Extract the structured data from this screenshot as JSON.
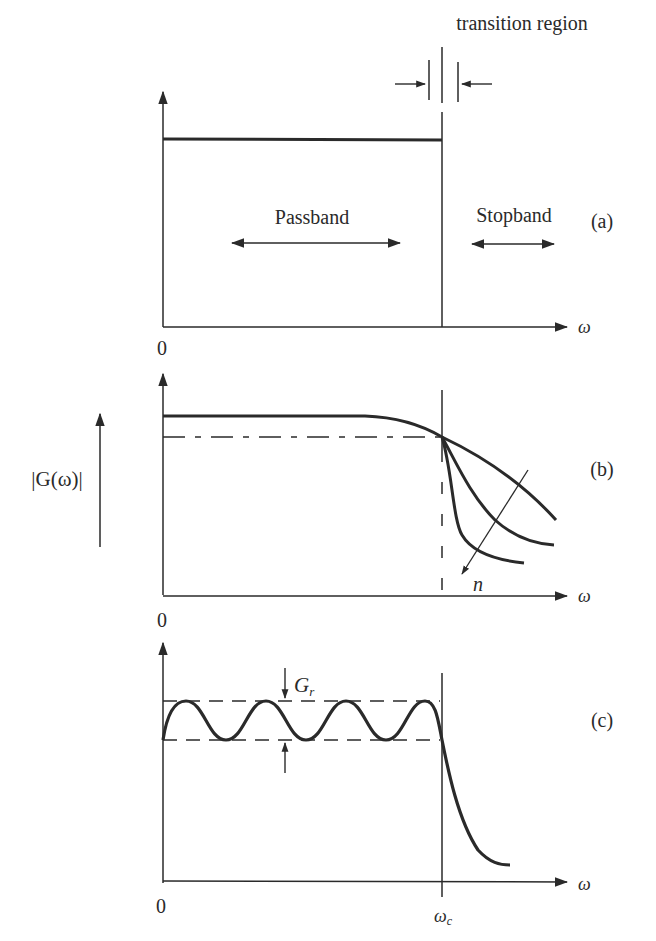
{
  "figure": {
    "transition_label": "transition region",
    "panel_a": {
      "tag": "(a)",
      "passband_label": "Passband",
      "stopband_label": "Stopband",
      "origin_label": "0",
      "x_axis_label": "ω"
    },
    "panel_b": {
      "tag": "(b)",
      "y_axis_label": "|G(ω)|",
      "origin_label": "0",
      "x_axis_label": "ω",
      "order_label": "n"
    },
    "panel_c": {
      "tag": "(c)",
      "ripple_label": "G",
      "ripple_subscript": "r",
      "origin_label": "0",
      "x_axis_label": "ω",
      "cutoff_label": "ω",
      "cutoff_subscript": "c"
    }
  },
  "colors": {
    "ink": "#2a2a2a",
    "background": "#ffffff"
  }
}
